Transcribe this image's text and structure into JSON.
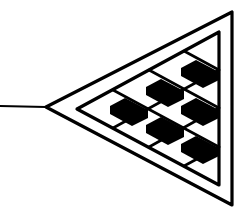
{
  "figure": {
    "description": "Line-art emblem: left-pointing double-outlined triangle with a checkered/flag pattern inside and a stem line extending left from the apex",
    "icon_name": "triangle-checkered-emblem-icon",
    "colors": {
      "ink": "#000000",
      "background": "#ffffff"
    }
  }
}
